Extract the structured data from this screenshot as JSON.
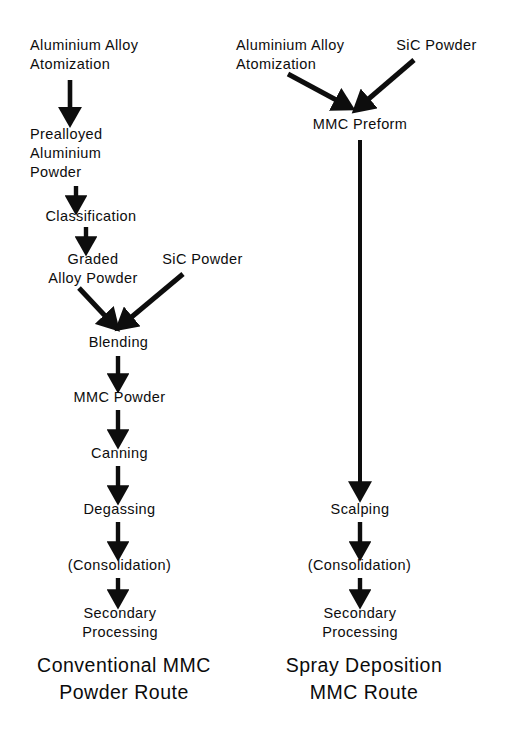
{
  "diagram": {
    "background_color": "#ffffff",
    "ink_color": "#0d0d0d",
    "width": 507,
    "height": 741
  },
  "columns": [
    {
      "id": "conventional",
      "caption": "Conventional MMC\nPowder Route",
      "nodes": [
        {
          "id": "l1",
          "label": "Aluminium Alloy\nAtomization",
          "x": 30,
          "y": 36,
          "w": 155
        },
        {
          "id": "l2",
          "label": "Prealloyed\nAluminium\nPowder",
          "x": 30,
          "y": 125,
          "w": 125
        },
        {
          "id": "l3",
          "label": "Classification",
          "x": 26,
          "y": 207,
          "w": 130
        },
        {
          "id": "l4",
          "label": "Graded\nAlloy Powder",
          "x": 32,
          "y": 250,
          "w": 122
        },
        {
          "id": "l5",
          "label": "SiC Powder",
          "x": 150,
          "y": 250,
          "w": 105
        },
        {
          "id": "l6",
          "label": "Blending",
          "x": 77,
          "y": 333,
          "w": 83
        },
        {
          "id": "l7",
          "label": "MMC Powder",
          "x": 63,
          "y": 388,
          "w": 113
        },
        {
          "id": "l8",
          "label": "Canning",
          "x": 80,
          "y": 444,
          "w": 79
        },
        {
          "id": "l9",
          "label": "Degassing",
          "x": 72,
          "y": 500,
          "w": 95
        },
        {
          "id": "l10",
          "label": "(Consolidation)",
          "x": 54,
          "y": 556,
          "w": 131
        },
        {
          "id": "l11",
          "label": "Secondary\nProcessing",
          "x": 68,
          "y": 604,
          "w": 104
        }
      ],
      "caption_pos": {
        "x": 8,
        "y": 652,
        "w": 232
      }
    },
    {
      "id": "spray",
      "caption": "Spray Deposition\nMMC Route",
      "nodes": [
        {
          "id": "r1",
          "label": "Aluminium Alloy\nAtomization",
          "x": 236,
          "y": 36,
          "w": 155
        },
        {
          "id": "r2",
          "label": "SiC Powder",
          "x": 383,
          "y": 36,
          "w": 107
        },
        {
          "id": "r3",
          "label": "MMC Preform",
          "x": 300,
          "y": 115,
          "w": 120
        },
        {
          "id": "r4",
          "label": "Scalping",
          "x": 322,
          "y": 500,
          "w": 76
        },
        {
          "id": "r5",
          "label": "(Consolidation)",
          "x": 294,
          "y": 556,
          "w": 131
        },
        {
          "id": "r6",
          "label": "Secondary\nProcessing",
          "x": 308,
          "y": 604,
          "w": 104
        }
      ],
      "caption_pos": {
        "x": 248,
        "y": 652,
        "w": 232
      }
    }
  ],
  "connections": [
    {
      "id": "a1",
      "type": "vertical",
      "from": "Aluminium Alloy Atomization",
      "to": "Prealloyed Aluminium Powder",
      "x": 70,
      "y1": 80,
      "y2": 118
    },
    {
      "id": "a2",
      "type": "vertical",
      "from": "Prealloyed Aluminium Powder",
      "to": "Classification",
      "x": 76,
      "y1": 186,
      "y2": 205
    },
    {
      "id": "a3",
      "type": "vertical",
      "from": "Classification",
      "to": "Graded Alloy Powder",
      "x": 86,
      "y1": 227,
      "y2": 246
    },
    {
      "id": "a4",
      "type": "diagonal",
      "from": "Graded Alloy Powder",
      "to": "Blending",
      "x1": 79,
      "y1": 288,
      "x2": 114,
      "y2": 325
    },
    {
      "id": "a5",
      "type": "diagonal",
      "from": "SiC Powder",
      "to": "Blending",
      "x1": 180,
      "y1": 274,
      "x2": 122,
      "y2": 325
    },
    {
      "id": "a6",
      "type": "vertical",
      "from": "Blending",
      "to": "MMC Powder",
      "x": 118,
      "y1": 356,
      "y2": 384
    },
    {
      "id": "a7",
      "type": "vertical",
      "from": "MMC Powder",
      "to": "Canning",
      "x": 118,
      "y1": 410,
      "y2": 440
    },
    {
      "id": "a8",
      "type": "vertical",
      "from": "Canning",
      "to": "Degassing",
      "x": 118,
      "y1": 466,
      "y2": 496
    },
    {
      "id": "a9",
      "type": "vertical",
      "from": "Degassing",
      "to": "(Consolidation)",
      "x": 118,
      "y1": 522,
      "y2": 552
    },
    {
      "id": "a10",
      "type": "vertical",
      "from": "(Consolidation)",
      "to": "Secondary Processing",
      "x": 118,
      "y1": 578,
      "y2": 600
    },
    {
      "id": "b1",
      "type": "diagonal",
      "from": "Aluminium Alloy Atomization",
      "to": "MMC Preform",
      "x1": 290,
      "y1": 76,
      "x2": 346,
      "y2": 107
    },
    {
      "id": "b2",
      "type": "diagonal",
      "from": "SiC Powder",
      "to": "MMC Preform",
      "x1": 410,
      "y1": 62,
      "x2": 358,
      "y2": 107
    },
    {
      "id": "b3",
      "type": "vertical-long",
      "from": "MMC Preform",
      "to": "Scalping",
      "x": 360,
      "y1": 140,
      "y2": 494
    },
    {
      "id": "b4",
      "type": "vertical",
      "from": "Scalping",
      "to": "(Consolidation)",
      "x": 360,
      "y1": 522,
      "y2": 552
    },
    {
      "id": "b5",
      "type": "vertical",
      "from": "(Consolidation)",
      "to": "Secondary Processing",
      "x": 360,
      "y1": 578,
      "y2": 600
    }
  ]
}
